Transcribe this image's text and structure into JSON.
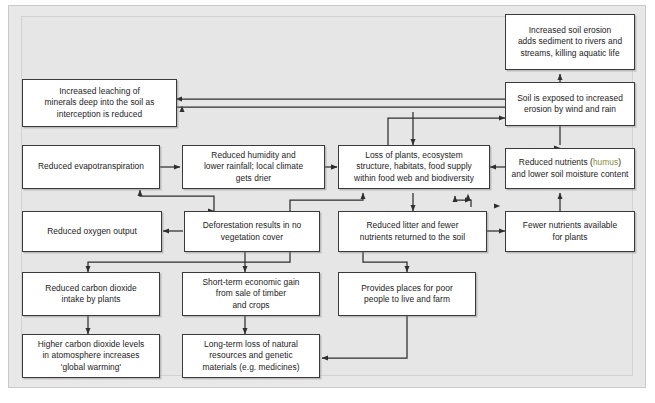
{
  "diagram": {
    "background_color": "#e6e6e6",
    "box_fill_color": "#ffffff",
    "box_border_color": "#3a3a3a",
    "highlight_color": "#8a8d3a",
    "nodes": [
      {
        "id": "increased-soil-erosion",
        "label": "Increased soil erosion\nadds sediment to rivers and\nstreams, killing aquatic life"
      },
      {
        "id": "increased-leaching",
        "label": "Increased leaching of\nminerals deep into the soil as\ninterception is reduced"
      },
      {
        "id": "soil-exposed-erosion",
        "label": "Soil is exposed to increased\nerosion by wind and rain"
      },
      {
        "id": "reduced-evapotranspiration",
        "label": "Reduced evapotranspiration"
      },
      {
        "id": "reduced-humidity",
        "label": "Reduced humidity and\nlower rainfall; local climate\ngets drier"
      },
      {
        "id": "loss-of-plants",
        "label": "Loss of plants, ecosystem\nstructure, habitats, food supply\nwithin food web and biodiversity"
      },
      {
        "id": "reduced-nutrients",
        "label_before": "Reduced nutrients (",
        "label_highlight": "humus",
        "label_after": ")\nand lower soil moisture content"
      },
      {
        "id": "reduced-oxygen-output",
        "label": "Reduced oxygen output"
      },
      {
        "id": "deforestation",
        "label": "Deforestation results in no\nvegetation cover"
      },
      {
        "id": "reduced-litter",
        "label": "Reduced litter and fewer\nnutrients returned to the soil"
      },
      {
        "id": "fewer-nutrients",
        "label": "Fewer nutrients available\nfor plants"
      },
      {
        "id": "reduced-co2-intake",
        "label": "Reduced carbon dioxide\nintake by plants"
      },
      {
        "id": "short-term-economic-gain",
        "label": "Short-term economic gain\nfrom sale of timber\nand crops"
      },
      {
        "id": "provides-places",
        "label": "Provides places for poor\npeople to live and farm"
      },
      {
        "id": "higher-co2-levels",
        "label": "Higher carbon dioxide levels\nin atomosphere increases\n'global warming'"
      },
      {
        "id": "long-term-loss",
        "label": "Long-term loss of natural\nresources and genetic\nmaterials (e.g. medicines)"
      }
    ]
  }
}
